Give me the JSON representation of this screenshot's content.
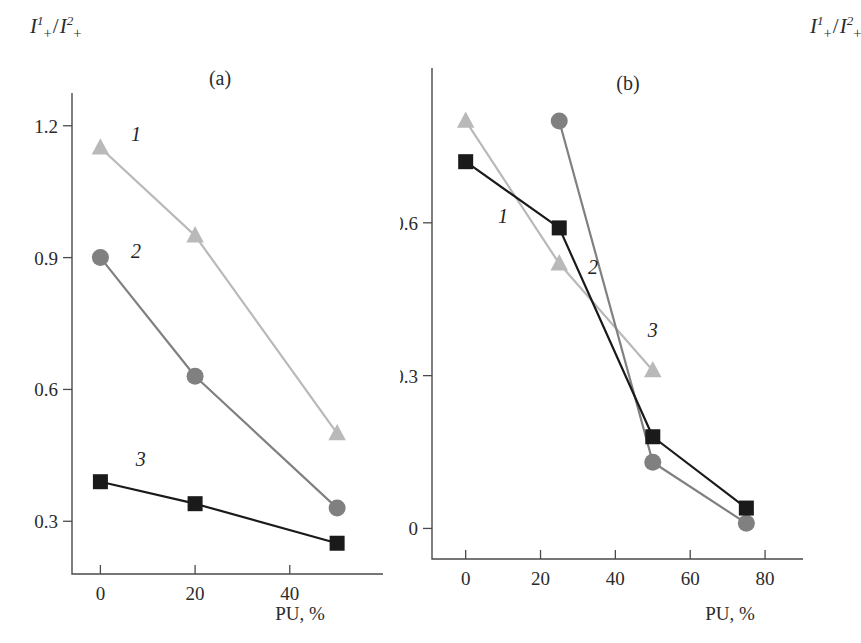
{
  "figure": {
    "background_color": "#ffffff",
    "y_axis_label_parts": {
      "numerator_symbol": "I",
      "numerator_sup": "1",
      "numerator_sub": "+",
      "separator": "/",
      "denominator_symbol": "I",
      "denominator_sup": "2",
      "denominator_sub": "+"
    },
    "series_colors": {
      "series_1": "#b9b9b9",
      "series_2": "#808080",
      "series_3": "#1a1a1a",
      "axis": "#4a4a4a"
    }
  },
  "chart_data": [
    {
      "type": "line",
      "panel": "a",
      "panel_tag": "(a)",
      "title": "",
      "xlabel": "PU, %",
      "ylabel": "I+1/I+2",
      "xlim": [
        -6,
        58
      ],
      "ylim": [
        0.18,
        1.27
      ],
      "xticks": [
        0,
        20,
        40
      ],
      "xtick_labels": [
        "0",
        "20",
        "40"
      ],
      "yticks": [
        0.3,
        0.6,
        0.9,
        1.2
      ],
      "ytick_labels": [
        "0.3",
        "0.6",
        "0.9",
        "1.2"
      ],
      "grid": false,
      "legend": "inline-series-numbers",
      "series": [
        {
          "name": "1",
          "label": "1",
          "marker": "triangle",
          "color": "#b9b9b9",
          "label_position": {
            "x": 7.5,
            "y": 1.165
          },
          "x": [
            0,
            20,
            50
          ],
          "values": [
            1.15,
            0.95,
            0.5
          ]
        },
        {
          "name": "2",
          "label": "2",
          "marker": "circle",
          "color": "#808080",
          "label_position": {
            "x": 7.5,
            "y": 0.9
          },
          "x": [
            0,
            20,
            50
          ],
          "values": [
            0.9,
            0.63,
            0.33
          ]
        },
        {
          "name": "3",
          "label": "3",
          "marker": "square",
          "color": "#1a1a1a",
          "label_position": {
            "x": 8.5,
            "y": 0.425
          },
          "x": [
            0,
            20,
            50
          ],
          "values": [
            0.39,
            0.34,
            0.25
          ]
        }
      ]
    },
    {
      "type": "line",
      "panel": "b",
      "panel_tag": "(b)",
      "title": "",
      "xlabel": "PU, %",
      "ylabel": "I+1/I+2",
      "xlim": [
        -9,
        88
      ],
      "ylim": [
        -0.06,
        0.9
      ],
      "xticks": [
        0,
        20,
        40,
        60,
        80
      ],
      "xtick_labels": [
        "0",
        "20",
        "40",
        "60",
        "80"
      ],
      "yticks": [
        0,
        0.3,
        0.6
      ],
      "ytick_labels": [
        "0",
        "0.3",
        "0.6"
      ],
      "grid": false,
      "legend": "inline-series-numbers",
      "series": [
        {
          "name": "1",
          "label": "1",
          "marker": "triangle",
          "color": "#b9b9b9",
          "label_position": {
            "x": 10.0,
            "y": 0.6
          },
          "x": [
            0,
            25,
            50
          ],
          "values": [
            0.8,
            0.52,
            0.31
          ]
        },
        {
          "name": "2",
          "label": "2",
          "marker": "circle",
          "color": "#808080",
          "label_position": {
            "x": 34.0,
            "y": 0.5
          },
          "x": [
            25,
            50,
            75
          ],
          "values": [
            0.8,
            0.13,
            0.01
          ]
        },
        {
          "name": "3",
          "label": "3",
          "marker": "square",
          "color": "#1a1a1a",
          "label_position": {
            "x": 50.0,
            "y": 0.375
          },
          "x": [
            0,
            25,
            50,
            75
          ],
          "values": [
            0.72,
            0.59,
            0.18,
            0.04
          ]
        }
      ]
    }
  ]
}
